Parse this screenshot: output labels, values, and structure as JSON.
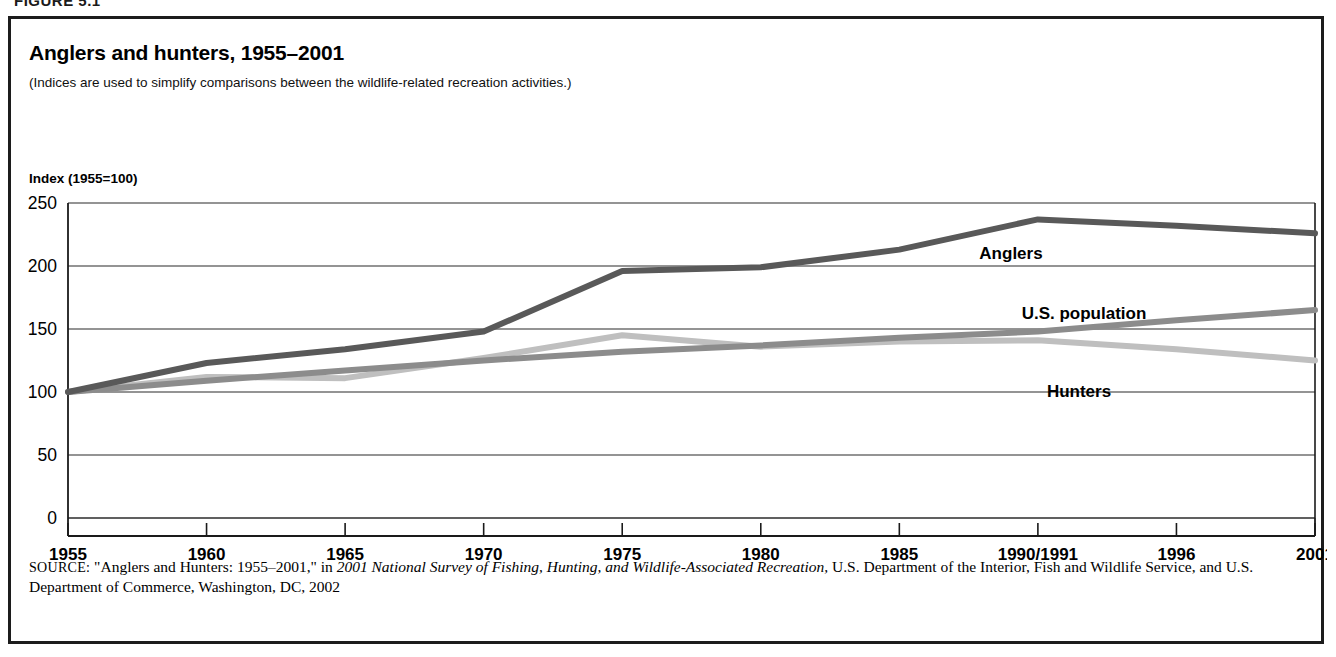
{
  "figure": {
    "caption": "FIGURE 5.1"
  },
  "chart": {
    "title": "Anglers and hunters, 1955–2001",
    "subtitle": "(Indices are used to simplify comparisons between the wildlife-related recreation activities.)",
    "axis_title": "Index (1955=100)"
  },
  "source": {
    "label": "SOURCE:",
    "text_before_italic": " \"Anglers and Hunters: 1955–2001,\" in ",
    "italic_text": "2001 National Survey of Fishing, Hunting, and Wildlife-Associated Recreation,",
    "text_after_italic": " U.S. Department of the Interior, Fish and Wildlife Service, and U.S. Department of Commerce, Washington, DC, 2002"
  },
  "series_labels": {
    "anglers": "Anglers",
    "us_population": "U.S. population",
    "hunters": "Hunters"
  },
  "colors": {
    "anglers": "#595959",
    "us_population": "#8c8c8c",
    "hunters": "#bfbfbf",
    "axis": "#1a1a1a",
    "gridline": "#2b2b2b",
    "frame": "#1c1c1c",
    "background": "#ffffff"
  },
  "chart_data": {
    "type": "line",
    "title": "Anglers and hunters, 1955–2001",
    "subtitle": "(Indices are used to simplify comparisons between the wildlife-related recreation activities.)",
    "xlabel": "",
    "ylabel": "Index (1955=100)",
    "categories": [
      "1955",
      "1960",
      "1965",
      "1970",
      "1975",
      "1980",
      "1985",
      "1990/1991",
      "1996",
      "2001"
    ],
    "ylim": [
      0,
      250
    ],
    "yticks": [
      0,
      50,
      100,
      150,
      200,
      250
    ],
    "grid": true,
    "legend": "inline-labels",
    "series": [
      {
        "name": "Anglers",
        "color": "#595959",
        "values": [
          100,
          123,
          134,
          148,
          196,
          199,
          213,
          237,
          232,
          226
        ]
      },
      {
        "name": "U.S. population",
        "color": "#8c8c8c",
        "values": [
          100,
          109,
          117,
          125,
          132,
          137,
          143,
          148,
          157,
          165
        ]
      },
      {
        "name": "Hunters",
        "color": "#bfbfbf",
        "values": [
          100,
          112,
          111,
          127,
          145,
          136,
          140,
          141,
          134,
          125
        ]
      }
    ]
  }
}
